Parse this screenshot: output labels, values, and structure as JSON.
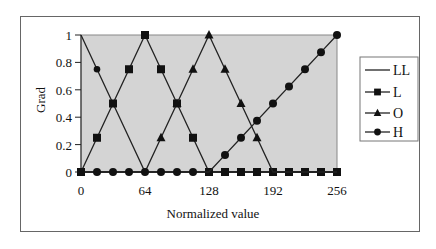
{
  "chart_data": {
    "type": "line",
    "title": "",
    "xlabel": "Normalized value",
    "ylabel": "Grad",
    "xlim": [
      0,
      256
    ],
    "ylim": [
      0,
      1
    ],
    "x_ticks": [
      "0",
      "64",
      "128",
      "192",
      "256"
    ],
    "y_ticks": [
      "0",
      "0.2",
      "0.4",
      "0.6",
      "0.8",
      "1"
    ],
    "grid": false,
    "plot_background": "#d4d4d4",
    "legend_position": "right",
    "x": [
      0,
      16,
      32,
      48,
      64,
      80,
      96,
      112,
      128,
      144,
      160,
      176,
      192,
      208,
      224,
      240,
      256
    ],
    "series": [
      {
        "name": "LL",
        "marker": "none",
        "values": [
          1,
          0.75,
          0.5,
          0.25,
          0,
          0,
          0,
          0,
          0,
          0,
          0,
          0,
          0,
          0,
          0,
          0,
          0
        ]
      },
      {
        "name": "L",
        "marker": "square",
        "values": [
          0,
          0.25,
          0.5,
          0.75,
          1,
          0.75,
          0.5,
          0.25,
          0,
          0,
          0,
          0,
          0,
          0,
          0,
          0,
          0
        ]
      },
      {
        "name": "O",
        "marker": "triangle",
        "values": [
          0,
          0,
          0,
          0,
          0,
          0.25,
          0.5,
          0.75,
          1,
          0.75,
          0.5,
          0.25,
          0,
          0,
          0,
          0,
          0
        ]
      },
      {
        "name": "H",
        "marker": "circle",
        "values": [
          0,
          0,
          0,
          0,
          0,
          0,
          0,
          0,
          0,
          0.125,
          0.25,
          0.375,
          0.5,
          0.625,
          0.75,
          0.875,
          1
        ]
      }
    ]
  },
  "legend": {
    "items": [
      {
        "label": "LL",
        "icon": "line-icon"
      },
      {
        "label": "L",
        "icon": "square-marker-icon"
      },
      {
        "label": "O",
        "icon": "triangle-marker-icon"
      },
      {
        "label": "H",
        "icon": "circle-marker-icon"
      }
    ]
  },
  "axes": {
    "x_title": "Normalized value",
    "y_title": "Grad"
  }
}
